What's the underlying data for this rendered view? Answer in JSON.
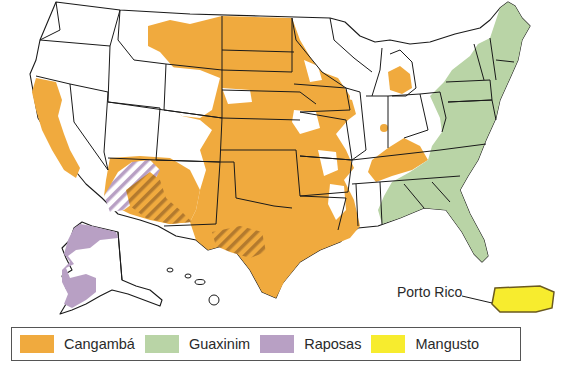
{
  "map": {
    "subject": "Distribuição de animais transmissores de raiva nos Estados Unidos",
    "colors": {
      "cangamba": "#F0AA3E",
      "guaxinim": "#B9D4A6",
      "raposas": "#B8A0C4",
      "mangusto": "#F7EC2E",
      "overlap_hatch": "#B37A2E",
      "border": "#1a1a1a",
      "background": "#ffffff"
    },
    "annotations": {
      "puerto_rico_label": "Porto Rico"
    }
  },
  "legend": {
    "items": [
      {
        "label": "Cangambá",
        "color": "#F0AA3E"
      },
      {
        "label": "Guaxinim",
        "color": "#B9D4A6"
      },
      {
        "label": "Raposas",
        "color": "#B8A0C4"
      },
      {
        "label": "Mangusto",
        "color": "#F7EC2E"
      }
    ]
  }
}
